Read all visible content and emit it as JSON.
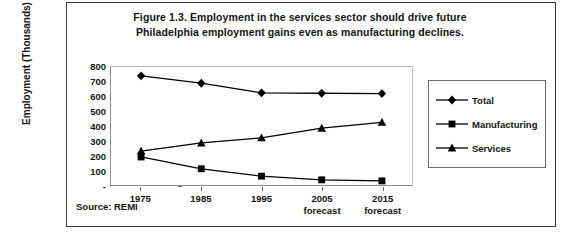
{
  "figure": {
    "title_line1": "Figure 1.3. Employment in the services sector should drive future",
    "title_line2": "Philadelphia employment gains even as manufacturing declines.",
    "source": "Source: REMI"
  },
  "axes": {
    "ylabel": "Employment (Thousands)",
    "ytick_labels": [
      "800",
      "700",
      "600",
      "500",
      "400",
      "300",
      "200",
      "100",
      "-"
    ],
    "xtick_labels": [
      {
        "year": "1975",
        "note": ""
      },
      {
        "year": "1985",
        "note": ""
      },
      {
        "year": "1995",
        "note": ""
      },
      {
        "year": "2005",
        "note": "forecast"
      },
      {
        "year": "2015",
        "note": "forecast"
      }
    ]
  },
  "legend": {
    "position": "right",
    "items": [
      {
        "label": "Total",
        "marker": "diamond-marker",
        "color": "#000000"
      },
      {
        "label": "Manufacturing",
        "marker": "square-marker",
        "color": "#000000"
      },
      {
        "label": "Services",
        "marker": "triangle-marker",
        "color": "#000000"
      }
    ]
  },
  "chart_data": {
    "type": "line",
    "title": "Figure 1.3. Employment in the services sector should drive future Philadelphia employment gains even as manufacturing declines.",
    "xlabel": "",
    "ylabel": "Employment (Thousands)",
    "categories": [
      "1975",
      "1985",
      "1995",
      "2005 forecast",
      "2015 forecast"
    ],
    "ylim": [
      0,
      800
    ],
    "ytick_values": [
      0,
      100,
      200,
      300,
      400,
      500,
      600,
      700,
      800
    ],
    "grid": false,
    "legend_position": "right",
    "series": [
      {
        "name": "Total",
        "marker": "diamond",
        "color": "#000000",
        "values": [
          740,
          690,
          625,
          622,
          620
        ]
      },
      {
        "name": "Manufacturing",
        "marker": "square",
        "color": "#000000",
        "values": [
          190,
          110,
          60,
          35,
          28
        ]
      },
      {
        "name": "Services",
        "marker": "triangle",
        "color": "#000000",
        "values": [
          230,
          285,
          320,
          385,
          425
        ]
      }
    ]
  }
}
